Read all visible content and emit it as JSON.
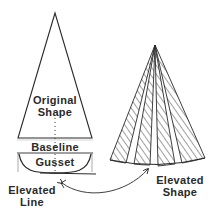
{
  "diagram": {
    "colors": {
      "stroke": "#2a2a2a",
      "background": "#ffffff",
      "text": "#2a2a2a"
    },
    "original_shape": {
      "label_line1": "Original",
      "label_line2": "Shape"
    },
    "baseline": {
      "label": "Baseline"
    },
    "gusset": {
      "label": "Gusset"
    },
    "elevated_line": {
      "label_line1": "Elevated",
      "label_line2": "Line"
    },
    "elevated_shape": {
      "label_line1": "Elevated",
      "label_line2": "Shape",
      "hatched_segments": 4
    }
  }
}
